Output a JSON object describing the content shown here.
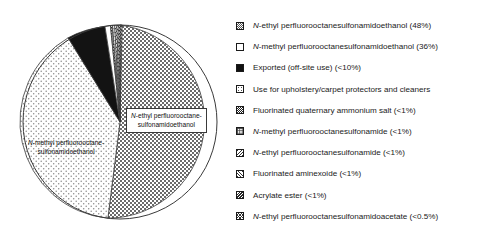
{
  "chart_data": {
    "type": "pie",
    "title": "",
    "subtitle": "",
    "xlabel": "",
    "ylabel": "",
    "legend_position": "right",
    "grid": false,
    "categories": [
      "N-ethyl perfluorooctanesulfonamidoethanol",
      "N-methyl perfluorooctanesulfonamidoethanol",
      "Exported (off-site use)",
      "Use for upholstery/carpet protectors and cleaners",
      "Fluorinated quaternary ammonium salt",
      "N-methyl perfluorooctanesulfonamide",
      "N-ethyl perfluorooctanesulfonamide",
      "Fluorinated aminexoide",
      "Acrylate ester",
      "N-ethyl perfluorooctanesulfonamidoacetate"
    ],
    "values": [
      48,
      36,
      9,
      2.6,
      1,
      1,
      1,
      1,
      0.9,
      0.5
    ],
    "value_labels": [
      "48%",
      "36%",
      "<10%",
      "",
      "<1%",
      "<1%",
      "<1%",
      "<1%",
      "<1%",
      "<0.5%"
    ],
    "patterns": [
      "checker-med",
      "dots-light",
      "solid-black",
      "empty-white",
      "checker-dark",
      "grid",
      "diagonal-right",
      "diagonal-left",
      "diagonal-dense",
      "cross-hatch"
    ]
  },
  "pie": {
    "inner_labels": [
      {
        "line1": "N-ethyl perfluorooctane-",
        "line2": "sulfonamidoethanol"
      },
      {
        "line1": "N-methyl perfluorooctane-",
        "line2": "sulfonamidoethanol"
      }
    ]
  },
  "legend": {
    "items": [
      {
        "italic": "N",
        "text": "-ethyl perfluorooctanesulfonamidoethanol (48%)",
        "pattern": "sw-checker-med"
      },
      {
        "italic": "N",
        "text": "-methyl perfluorooctanesulfonamidoethanol (36%)",
        "pattern": "sw-empty"
      },
      {
        "italic": "",
        "text": "Exported (off-site use) (<10%)",
        "pattern": "sw-solid"
      },
      {
        "italic": "",
        "text": "Use for upholstery/carpet protectors and cleaners",
        "pattern": "sw-dots-light"
      },
      {
        "italic": "",
        "text": "Fluorinated quaternary ammonium salt (<1%)",
        "pattern": "sw-checker-dark"
      },
      {
        "italic": "N",
        "text": "-methyl perfluorooctanesulfonamide (<1%)",
        "pattern": "sw-grid"
      },
      {
        "italic": "N",
        "text": "-ethyl perfluorooctanesulfonamide (<1%)",
        "pattern": "sw-diag-l"
      },
      {
        "italic": "",
        "text": "Fluorinated aminexoide (<1%)",
        "pattern": "sw-diag-r"
      },
      {
        "italic": "",
        "text": "Acrylate ester (<1%)",
        "pattern": "sw-diag-dense"
      },
      {
        "italic": "N",
        "text": "-ethyl perfluorooctanesulfonamidoacetate (<0.5%)",
        "pattern": "sw-cross"
      }
    ]
  },
  "colors": {
    "outline": "#3a3a3a",
    "text": "#1a1a1a",
    "background": "#ffffff"
  }
}
